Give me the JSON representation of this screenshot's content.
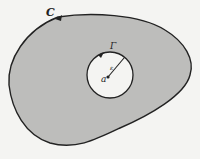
{
  "diagram": {
    "outer_contour_label": "C",
    "inner_circle_label": "Γ",
    "center_label": "a",
    "radius_label": "ε",
    "colors": {
      "region_fill": "#bdbdbb",
      "background": "#f4f4f2",
      "stroke": "#222222",
      "inner_fill": "#f4f4f2"
    }
  }
}
